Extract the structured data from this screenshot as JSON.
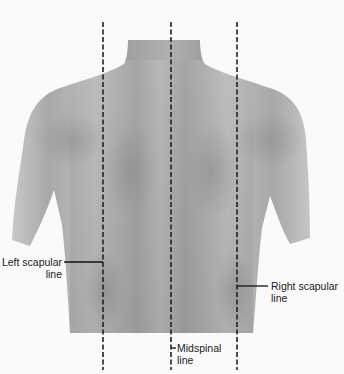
{
  "figure": {
    "background_color": "#fafafa",
    "skin_color": "#b4b4b4",
    "line_color": "#222222"
  },
  "reference_lines": [
    {
      "id": "left-scapular",
      "x": 103,
      "label_line1": "Left scapular",
      "label_line2": "line"
    },
    {
      "id": "midspinal",
      "x": 171,
      "label_line1": "Midspinal",
      "label_line2": "line"
    },
    {
      "id": "right-scapular",
      "x": 237,
      "label_line1": "Right scapular",
      "label_line2": "line"
    }
  ],
  "labels": {
    "left_scapular": {
      "line1": "Left scapular",
      "line2": "line"
    },
    "midspinal": {
      "line1": "Midspinal",
      "line2": "line"
    },
    "right_scapular": {
      "line1": "Right scapular",
      "line2": "line"
    }
  }
}
